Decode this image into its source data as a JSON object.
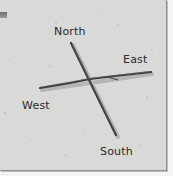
{
  "diagram": {
    "type": "stick-compass",
    "labels": {
      "north": "North",
      "east": "East",
      "west": "West",
      "south": "South"
    },
    "colors": {
      "paper": "#d9d9d7",
      "stick": "#3a3a38",
      "text": "#2a2a2a"
    }
  }
}
